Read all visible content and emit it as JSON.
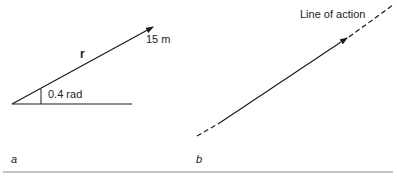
{
  "panel_a": {
    "vector_label": "r",
    "magnitude_label": "15 m",
    "angle_label": "0.4 rad",
    "caption": "a"
  },
  "panel_b": {
    "line_label": "Line of action",
    "caption": "b"
  },
  "colors": {
    "stroke": "#1a1a1a",
    "rule": "#888888"
  }
}
